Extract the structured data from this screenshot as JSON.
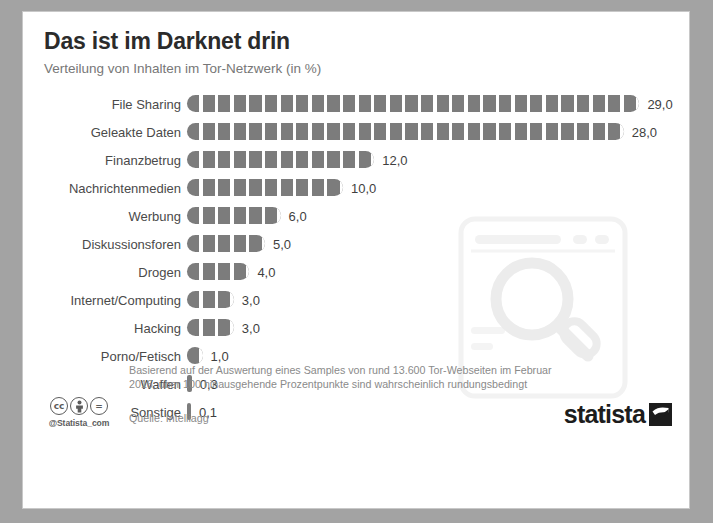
{
  "header": {
    "title": "Das ist im Darknet drin",
    "subtitle": "Verteilung von Inhalten im Tor-Netzwerk (in %)"
  },
  "chart_data": {
    "type": "bar",
    "orientation": "horizontal",
    "title": "Das ist im Darknet drin",
    "subtitle": "Verteilung von Inhalten im Tor-Netzwerk (in %)",
    "xlabel": "",
    "ylabel": "",
    "unit": "%",
    "grid": false,
    "legend": false,
    "xlim": [
      0,
      29
    ],
    "decimal_separator": ",",
    "bar_color": "#7c7c7c",
    "categories": [
      "File Sharing",
      "Geleakte Daten",
      "Finanzbetrug",
      "Nachrichtenmedien",
      "Werbung",
      "Diskussionsforen",
      "Drogen",
      "Internet/Computing",
      "Hacking",
      "Porno/Fetisch",
      "Waffen",
      "Sonstige"
    ],
    "values": [
      29.0,
      28.0,
      12.0,
      10.0,
      6.0,
      5.0,
      4.0,
      3.0,
      3.0,
      1.0,
      0.3,
      0.1
    ],
    "value_labels": [
      "29,0",
      "28,0",
      "12,0",
      "10,0",
      "6,0",
      "5,0",
      "4,0",
      "3,0",
      "3,0",
      "1,0",
      "0,3",
      "0,1"
    ]
  },
  "footer": {
    "footnote": "Basierend auf der Auswertung eines Samples von rund 13.600 Tor-Webseiten im Februar 2016; über 100 hinausgehende Prozentpunkte sind wahrscheinlich rundungsbedingt",
    "source": "Quelle: Intelliagg",
    "cc_badges": [
      "cc",
      "person",
      "="
    ],
    "handle": "@Statista_com",
    "brand": "statista"
  }
}
